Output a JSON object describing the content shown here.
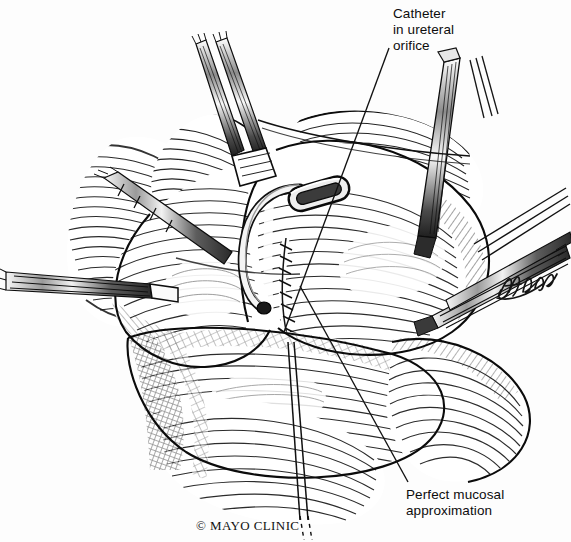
{
  "illustration": {
    "kind": "pen-and-ink surgical illustration",
    "subject": "ureteral reimplantation with catheter in ureteral orifice",
    "background_color": "#fdfdfd",
    "ink_color": "#151515",
    "width": 571,
    "height": 542
  },
  "annotations": {
    "catheter": {
      "text": "Catheter\nin ureteral\norifice",
      "leader_from": [
        389,
        48
      ],
      "leader_to": [
        284,
        332
      ]
    },
    "mucosal": {
      "text": "Perfect mucosal\napproximation",
      "leader_from": [
        408,
        482
      ],
      "leader_to": [
        300,
        286
      ]
    }
  },
  "credits": {
    "copyright": "© MAYO CLINIC",
    "signature_name": "JKHagen"
  }
}
